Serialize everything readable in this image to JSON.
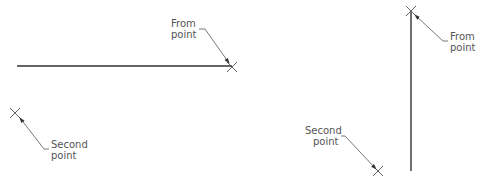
{
  "figures": [
    {
      "name": "horizontal-example",
      "from_label": [
        "From",
        "point"
      ],
      "second_label": [
        "Second",
        "point"
      ]
    },
    {
      "name": "vertical-example",
      "from_label": [
        "From",
        "point"
      ],
      "second_label": [
        "Second",
        "point"
      ]
    }
  ],
  "colors": {
    "line": "#333333",
    "leader": "#555555",
    "text": "#555555"
  }
}
